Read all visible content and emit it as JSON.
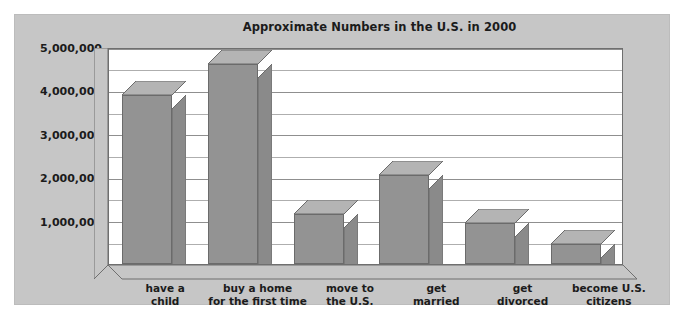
{
  "chart_data": {
    "type": "bar",
    "title": "Approximate Numbers in the U.S. in 2000",
    "xlabel": "",
    "ylabel": "",
    "categories": [
      "have a child",
      "buy a home for the first time",
      "move to the U.S.",
      "get married",
      "get divorced",
      "become U.S. citizens"
    ],
    "category_lines": [
      [
        "have a",
        "child"
      ],
      [
        "buy a home",
        "for the first time"
      ],
      [
        "move to",
        "the U.S."
      ],
      [
        "get",
        "married"
      ],
      [
        "get",
        "divorced"
      ],
      [
        "become U.S.",
        "citizens"
      ]
    ],
    "values": [
      3900000,
      4600000,
      1150000,
      2050000,
      950000,
      450000
    ],
    "ylim": [
      0,
      5000000
    ],
    "ytick_values": [
      0,
      1000000,
      2000000,
      3000000,
      4000000,
      5000000
    ],
    "ytick_labels": [
      "0",
      "1,000,000",
      "2,000,000",
      "3,000,000",
      "4,000,000",
      "5,000,000"
    ],
    "minor_tick_interval": 500000,
    "grid": true,
    "legend": false,
    "style": "3d-column",
    "colors": {
      "bar_front": "#939393",
      "bar_top": "#b4b4b4",
      "bar_side": "#8a8a8a",
      "bar_outline": "#6b6b6b",
      "panel_background": "#c6c6c6",
      "plot_background": "#ffffff",
      "gridline": "#8f8f8f",
      "gridline_minor": "#aeaeae",
      "text": "#1b1b1b",
      "page_background": "#ffffff"
    }
  }
}
